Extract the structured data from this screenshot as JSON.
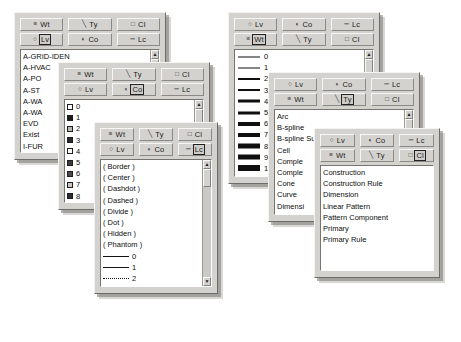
{
  "app": {
    "description": "Overlapping CAD attribute picker palettes",
    "background_color": "#ffffff",
    "panel_face_color": "#d4d2ce",
    "list_background_color": "#ffffff"
  },
  "toolbar_buttons": {
    "wt": {
      "label": "Wt",
      "icon": "weight-icon",
      "glyph": "≡"
    },
    "ty": {
      "label": "Ty",
      "icon": "linetype-icon",
      "glyph": "╲"
    },
    "cl": {
      "label": "Cl",
      "icon": "class-icon",
      "glyph": "□"
    },
    "lv": {
      "label": "Lv",
      "icon": "level-icon",
      "glyph": "○"
    },
    "co": {
      "label": "Co",
      "icon": "color-icon",
      "glyph": "◐"
    },
    "lc": {
      "label": "Lc",
      "icon": "linecode-icon",
      "glyph": "═"
    }
  },
  "panels": [
    {
      "id": "level-panel",
      "name": "Level",
      "selected_button": "lv",
      "row_top": [
        "wt",
        "ty",
        "cl"
      ],
      "row_bottom": [
        "lv",
        "co",
        "lc"
      ],
      "list_kind": "text",
      "scrollbar": true,
      "items": [
        {
          "label": "A-GRID-IDEN"
        },
        {
          "label": "A-HVAC"
        },
        {
          "label": "A-PO"
        },
        {
          "label": "A-ST"
        },
        {
          "label": "A-WA"
        },
        {
          "label": "A-WA"
        },
        {
          "label": "EVD"
        },
        {
          "label": "Exist"
        },
        {
          "label": "I-FUR"
        },
        {
          "label": "I-FUR"
        },
        {
          "label": "I-SYS"
        },
        {
          "label": "New"
        },
        {
          "label": "optio"
        }
      ]
    },
    {
      "id": "color-panel",
      "name": "Color",
      "selected_button": "co",
      "row_top": [
        "wt",
        "ty",
        "cl"
      ],
      "row_bottom": [
        "lv",
        "co",
        "lc"
      ],
      "list_kind": "swatch",
      "scrollbar": true,
      "items": [
        {
          "label": "0",
          "swatch": "#ffffff"
        },
        {
          "label": "1",
          "swatch": "#1a1a1a"
        },
        {
          "label": "2",
          "swatch": "#b9b7b3"
        },
        {
          "label": "3",
          "swatch": "#2a2a2a"
        },
        {
          "label": "4",
          "swatch": "#ffffff"
        },
        {
          "label": "5",
          "swatch": "#3a3a3a"
        },
        {
          "label": "6",
          "swatch": "#4a4a4a"
        },
        {
          "label": "7",
          "swatch": "#c8c6c2"
        },
        {
          "label": "8",
          "swatch": "#2e2e2e"
        },
        {
          "label": "9",
          "swatch": "#8e8c88"
        },
        {
          "label": "10",
          "swatch": "#5a5a5a"
        },
        {
          "label": "11",
          "swatch": "#d8d6d2"
        },
        {
          "label": "12",
          "swatch": "#eceae6"
        }
      ]
    },
    {
      "id": "linecode-panel",
      "name": "Line Code",
      "selected_button": "lc",
      "row_top": [
        "wt",
        "ty",
        "cl"
      ],
      "row_bottom": [
        "lv",
        "co",
        "lc"
      ],
      "list_kind": "linestyle",
      "scrollbar": true,
      "items": [
        {
          "label": "( Border )",
          "style": "none"
        },
        {
          "label": "( Center )",
          "style": "none"
        },
        {
          "label": "( Dashdot )",
          "style": "none"
        },
        {
          "label": "( Dashed )",
          "style": "none"
        },
        {
          "label": "( Divide )",
          "style": "none"
        },
        {
          "label": "( Dot )",
          "style": "none"
        },
        {
          "label": "( Hidden )",
          "style": "none"
        },
        {
          "label": "( Phantom )",
          "style": "none"
        },
        {
          "label": "0",
          "style": "solid"
        },
        {
          "label": "1",
          "style": "solid-thin"
        },
        {
          "label": "2",
          "style": "dotted"
        },
        {
          "label": "3",
          "style": "dashed"
        },
        {
          "label": "4",
          "style": "dashdot"
        }
      ]
    },
    {
      "id": "weight-panel",
      "name": "Weight",
      "selected_button": "wt",
      "row_top": [
        "lv",
        "co",
        "lc"
      ],
      "row_bottom": [
        "wt",
        "ty",
        "cl"
      ],
      "list_kind": "weight",
      "scrollbar": true,
      "items": [
        {
          "label": "0",
          "weight": 1
        },
        {
          "label": "1",
          "weight": 1
        },
        {
          "label": "2",
          "weight": 2
        },
        {
          "label": "3",
          "weight": 2
        },
        {
          "label": "4",
          "weight": 3
        },
        {
          "label": "5",
          "weight": 3
        },
        {
          "label": "6",
          "weight": 4
        },
        {
          "label": "7",
          "weight": 4
        },
        {
          "label": "8",
          "weight": 5
        },
        {
          "label": "9",
          "weight": 5
        },
        {
          "label": "10",
          "weight": 6
        },
        {
          "label": "11",
          "weight": 6
        },
        {
          "label": "12",
          "weight": 7
        }
      ]
    },
    {
      "id": "type-panel",
      "name": "Type",
      "selected_button": "ty",
      "row_top": [
        "lv",
        "co",
        "lc"
      ],
      "row_bottom": [
        "wt",
        "ty",
        "cl"
      ],
      "list_kind": "text",
      "scrollbar": true,
      "items": [
        {
          "label": "Arc"
        },
        {
          "label": "B-spline"
        },
        {
          "label": "B-spline Surface"
        },
        {
          "label": "Cell"
        },
        {
          "label": "Comple"
        },
        {
          "label": "Comple"
        },
        {
          "label": "Cone"
        },
        {
          "label": "Curve"
        },
        {
          "label": "Dimensi"
        },
        {
          "label": "Ellipse"
        },
        {
          "label": "Line"
        },
        {
          "label": "Line Stri"
        },
        {
          "label": "Mesh"
        }
      ]
    },
    {
      "id": "class-panel",
      "name": "Class",
      "selected_button": "cl",
      "row_top": [
        "lv",
        "co",
        "lc"
      ],
      "row_bottom": [
        "wt",
        "ty",
        "cl"
      ],
      "list_kind": "text",
      "scrollbar": false,
      "items": [
        {
          "label": "Construction"
        },
        {
          "label": "Construction Rule"
        },
        {
          "label": "Dimension"
        },
        {
          "label": "Linear Pattern"
        },
        {
          "label": "Pattern Component"
        },
        {
          "label": "Primary"
        },
        {
          "label": "Primary Rule"
        }
      ]
    }
  ],
  "scrollbar": {
    "up_arrow": "▲",
    "down_arrow": "▼"
  }
}
